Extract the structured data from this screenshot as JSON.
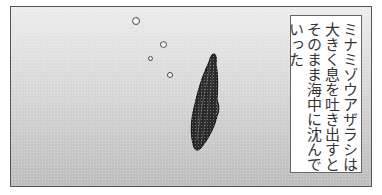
{
  "panel": {
    "caption_lines": [
      "ミナミゾウアザラシは",
      "大きく息を吐き出すと",
      "そのまま海中に沈んで",
      "いった"
    ],
    "caption_full": "ミナミゾウアザラシは大きく息を吐き出すとそのまま海中に沈んでいった",
    "illustration": "elephant seal diving underwater with air bubbles",
    "colors": {
      "border": "#555555",
      "background_top": "#ececec",
      "background_bottom": "#bdbdbd",
      "seal": "#2a2a2a",
      "caption_bg": "#ffffff",
      "caption_text": "#333333"
    }
  }
}
